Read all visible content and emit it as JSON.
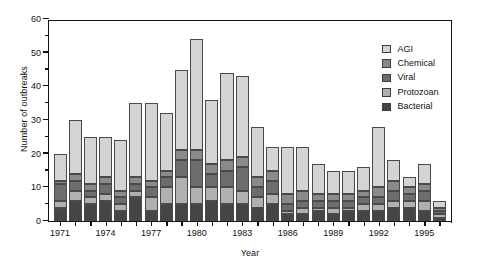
{
  "chart_data": {
    "type": "bar",
    "subtype": "stacked-vertical",
    "title": "",
    "xlabel": "Year",
    "ylabel": "Number of outbreaks",
    "ylim": [
      0,
      60
    ],
    "ytick_step": 10,
    "yminor_step": 5,
    "yticks": [
      0,
      10,
      20,
      30,
      40,
      50,
      60
    ],
    "grid": false,
    "legend_position": "top-right-inside",
    "xtick_labels": [
      "1971",
      "1974",
      "1977",
      "1980",
      "1983",
      "1986",
      "1989",
      "1992",
      "1995"
    ],
    "categories": [
      "1971",
      "1972",
      "1973",
      "1974",
      "1975",
      "1976",
      "1977",
      "1978",
      "1979",
      "1980",
      "1981",
      "1982",
      "1983",
      "1984",
      "1985",
      "1986",
      "1987",
      "1988",
      "1989",
      "1990",
      "1991",
      "1992",
      "1993",
      "1994",
      "1995",
      "1996"
    ],
    "series": [
      {
        "name": "Bacterial",
        "color": "#454545",
        "values": [
          4,
          6,
          5,
          6,
          3,
          7,
          3,
          5,
          5,
          5,
          6,
          5,
          5,
          4,
          5,
          2,
          2,
          3,
          2,
          3,
          3,
          3,
          4,
          4,
          3,
          1
        ]
      },
      {
        "name": "Protozoan",
        "color": "#b0b0b0",
        "values": [
          2,
          3,
          2,
          2,
          2,
          2,
          4,
          5,
          8,
          5,
          4,
          5,
          4,
          3,
          3,
          1,
          2,
          1,
          2,
          1,
          2,
          2,
          2,
          2,
          3,
          1
        ]
      },
      {
        "name": "Viral",
        "color": "#6d6d6d",
        "values": [
          5,
          3,
          2,
          3,
          2,
          2,
          3,
          3,
          5,
          8,
          4,
          5,
          7,
          3,
          4,
          2,
          2,
          2,
          2,
          2,
          2,
          2,
          3,
          2,
          3,
          1
        ]
      },
      {
        "name": "Chemical",
        "color": "#8a8a8a",
        "values": [
          1,
          2,
          2,
          2,
          2,
          2,
          2,
          2,
          3,
          3,
          3,
          3,
          3,
          3,
          3,
          3,
          3,
          2,
          2,
          2,
          2,
          3,
          3,
          2,
          2,
          1
        ]
      },
      {
        "name": "AGI",
        "color": "#d4d4d4",
        "values": [
          8,
          16,
          14,
          12,
          15,
          22,
          23,
          17,
          24,
          33,
          19,
          26,
          24,
          15,
          7,
          14,
          13,
          9,
          7,
          7,
          7,
          18,
          6,
          3,
          6,
          2
        ]
      }
    ],
    "totals": [
      20,
      30,
      25,
      25,
      24,
      35,
      35,
      32,
      45,
      54,
      36,
      44,
      43,
      28,
      22,
      22,
      22,
      17,
      15,
      15,
      16,
      28,
      18,
      13,
      17,
      6
    ]
  },
  "legend": {
    "entries": [
      {
        "label": "AGI",
        "color": "#d4d4d4"
      },
      {
        "label": "Chemical",
        "color": "#8a8a8a"
      },
      {
        "label": "Viral",
        "color": "#6d6d6d"
      },
      {
        "label": "Protozoan",
        "color": "#b0b0b0"
      },
      {
        "label": "Bacterial",
        "color": "#454545"
      }
    ]
  }
}
